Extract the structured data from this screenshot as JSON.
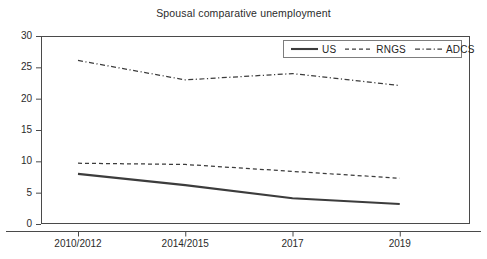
{
  "chart_data": {
    "type": "line",
    "title": "Spousal comparative unemployment",
    "xlabel": "",
    "ylabel": "",
    "categories": [
      "2010/2012",
      "2014/2015",
      "2017",
      "2019"
    ],
    "series": [
      {
        "name": "US",
        "values": [
          8.0,
          6.2,
          4.1,
          3.2
        ],
        "style": "solid"
      },
      {
        "name": "RNGS",
        "values": [
          9.7,
          9.5,
          8.4,
          7.3
        ],
        "style": "dashed"
      },
      {
        "name": "ADCS",
        "values": [
          26.1,
          23.0,
          24.0,
          22.1
        ],
        "style": "dash-dot"
      }
    ],
    "ylim": [
      0,
      30
    ],
    "yticks": [
      0,
      5,
      10,
      15,
      20,
      25,
      30
    ],
    "ytick_labels": [
      "0",
      "5",
      "10",
      "15",
      "20",
      "25",
      "30"
    ],
    "grid": false,
    "legend_position": "top-right",
    "line_color": "#3c3c3c",
    "frame_color": "#4a4a4a"
  },
  "legend": {
    "entries": [
      {
        "label": "US"
      },
      {
        "label": "RNGS"
      },
      {
        "label": "ADCS"
      }
    ]
  }
}
